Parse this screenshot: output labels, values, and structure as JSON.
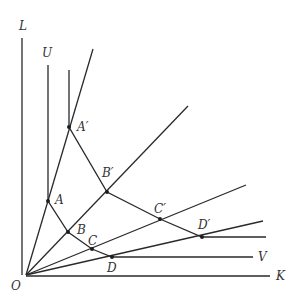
{
  "diagram": {
    "type": "isoquant-rays",
    "colors": {
      "line": "#2a2a2a",
      "label": "#333333",
      "background": "#ffffff"
    },
    "origin": {
      "label": "O",
      "x": 26,
      "y": 275
    },
    "axes": {
      "vertical": {
        "label": "L",
        "x1": 22,
        "y1": 38,
        "x2": 22,
        "y2": 275
      },
      "horizontal": {
        "label": "K",
        "x1": 26,
        "y1": 276,
        "x2": 270,
        "y2": 276
      }
    },
    "rays": [
      {
        "name": "ray-1",
        "x2": 93,
        "y2": 49
      },
      {
        "name": "ray-2",
        "x2": 188,
        "y2": 106
      },
      {
        "name": "ray-3",
        "x2": 246,
        "y2": 185
      },
      {
        "name": "ray-4",
        "x2": 263,
        "y2": 221
      }
    ],
    "isoquants": [
      {
        "name": "isoquant-lower",
        "start_label": "U",
        "end_label": "V",
        "points": "48,65 48,201 68,232 92,249 112,257 253,257"
      },
      {
        "name": "isoquant-upper",
        "points": "69,70 69,127 107,192 160,219 202,237 266,237"
      }
    ],
    "points": [
      {
        "label": "A",
        "x": 48,
        "y": 201,
        "lx": 55,
        "ly": 204
      },
      {
        "label": "B",
        "x": 68,
        "y": 232,
        "lx": 77,
        "ly": 234
      },
      {
        "label": "C",
        "x": 92,
        "y": 249,
        "lx": 88,
        "ly": 245
      },
      {
        "label": "D",
        "x": 112,
        "y": 257,
        "lx": 107,
        "ly": 272
      },
      {
        "label": "A′",
        "x": 69,
        "y": 127,
        "lx": 77,
        "ly": 131
      },
      {
        "label": "B′",
        "x": 107,
        "y": 192,
        "lx": 102,
        "ly": 177
      },
      {
        "label": "C′",
        "x": 160,
        "y": 219,
        "lx": 154,
        "ly": 213
      },
      {
        "label": "D′",
        "x": 202,
        "y": 237,
        "lx": 198,
        "ly": 229
      }
    ],
    "labels": {
      "L": {
        "text": "L",
        "x": 19,
        "y": 30
      },
      "U": {
        "text": "U",
        "x": 42,
        "y": 57
      },
      "V": {
        "text": "V",
        "x": 258,
        "y": 261
      },
      "K": {
        "text": "K",
        "x": 276,
        "y": 280
      },
      "O": {
        "text": "O",
        "x": 11,
        "y": 290
      }
    }
  }
}
